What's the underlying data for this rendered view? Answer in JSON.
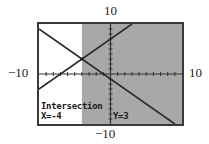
{
  "window": {
    "xmin": -10,
    "xmax": 10,
    "ymin": -10,
    "ymax": 10,
    "labels": {
      "top": "10",
      "bottom": "−10",
      "left": "−10",
      "right": "10"
    }
  },
  "screen": {
    "mode_label": "Intersection",
    "x_readout": "X=-4",
    "y_readout": "Y=3",
    "shade_color": "#a8a8a8",
    "line_color": "#2a2a2a"
  },
  "graph": {
    "shaded_region": "x >= -4",
    "functions": [
      {
        "name": "Y1",
        "expr": "y = x + 7"
      },
      {
        "name": "Y2",
        "expr": "y = -x - 1"
      }
    ],
    "intersection": {
      "x": -4,
      "y": 3
    }
  }
}
